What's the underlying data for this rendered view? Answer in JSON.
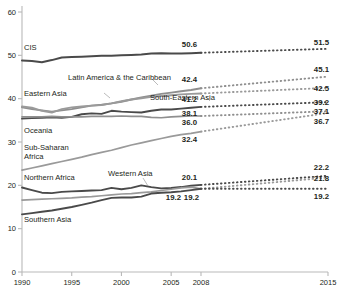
{
  "chart_data": {
    "type": "line",
    "title": "",
    "subtitle": "",
    "xlabel": "",
    "ylabel": "",
    "xlim": [
      1990,
      2015
    ],
    "ylim": [
      0,
      60
    ],
    "yticks": [
      "0",
      "10",
      "20",
      "30",
      "40",
      "50",
      "60"
    ],
    "ytick_values": [
      0,
      10,
      20,
      30,
      40,
      50,
      60
    ],
    "xticks": [
      "1990",
      "1995",
      "2000",
      "2005",
      "2008",
      "2015"
    ],
    "xtick_values": [
      1990,
      1995,
      2000,
      2005,
      2008,
      2015
    ],
    "grid": false,
    "legend": "inline-labels",
    "projection_start_year": 2008,
    "projection_end_year": 2015,
    "projection_style": "dotted",
    "series": [
      {
        "name": "CIS",
        "label": "CIS",
        "color": "#4a4a4a",
        "width": 2.0,
        "x": [
          1990,
          1991,
          1992,
          1993,
          1994,
          1995,
          1996,
          1997,
          1998,
          1999,
          2000,
          2001,
          2002,
          2003,
          2004,
          2005,
          2006,
          2007,
          2008
        ],
        "values": [
          48.8,
          48.7,
          48.4,
          48.9,
          49.5,
          49.6,
          49.7,
          49.8,
          49.9,
          49.9,
          50.0,
          50.1,
          50.2,
          50.4,
          50.5,
          50.4,
          50.4,
          50.5,
          50.6
        ],
        "value_2008": "50.6",
        "value_2015": "51.5",
        "projection": [
          50.6,
          51.5
        ]
      },
      {
        "name": "Latin America & the Caribbean",
        "label": "Latin America & the Caribbean",
        "color": "#8f8f8f",
        "width": 1.9,
        "x": [
          1990,
          1991,
          1992,
          1993,
          1994,
          1995,
          1996,
          1997,
          1998,
          1999,
          2000,
          2001,
          2002,
          2003,
          2004,
          2005,
          2006,
          2007,
          2008
        ],
        "values": [
          38.0,
          37.6,
          37.3,
          37.0,
          37.3,
          37.6,
          38.0,
          38.4,
          38.6,
          38.9,
          39.3,
          39.8,
          40.3,
          40.7,
          41.1,
          41.4,
          41.7,
          42.0,
          42.4
        ],
        "value_2008": "42.4",
        "value_2015": "45.1",
        "projection": [
          42.4,
          45.1
        ]
      },
      {
        "name": "Eastern Asia",
        "label": "Eastern Asia",
        "color": "#9a9a9a",
        "width": 1.9,
        "x": [
          1990,
          1991,
          1992,
          1993,
          1994,
          1995,
          1996,
          1997,
          1998,
          1999,
          2000,
          2001,
          2002,
          2003,
          2004,
          2005,
          2006,
          2007,
          2008
        ],
        "values": [
          38.2,
          37.9,
          37.2,
          36.8,
          37.6,
          38.0,
          38.2,
          38.4,
          38.5,
          38.9,
          39.4,
          39.8,
          40.1,
          40.4,
          40.6,
          40.8,
          41.0,
          41.1,
          41.2
        ],
        "value_2008": "41.2",
        "value_2015": "42.5",
        "projection": [
          41.2,
          42.5
        ]
      },
      {
        "name": "South-Eastern Asia",
        "label": "South-Eastern Asia",
        "color": "#4a4a4a",
        "width": 1.9,
        "x": [
          1990,
          1991,
          1992,
          1993,
          1994,
          1995,
          1996,
          1997,
          1998,
          1999,
          2000,
          2001,
          2002,
          2003,
          2004,
          2005,
          2006,
          2007,
          2008
        ],
        "values": [
          35.4,
          35.5,
          35.6,
          35.7,
          35.6,
          35.8,
          36.4,
          36.6,
          36.5,
          37.2,
          37.0,
          36.9,
          36.8,
          37.2,
          37.5,
          37.5,
          37.7,
          37.9,
          38.1
        ],
        "value_2008": "38.1",
        "value_2015": "39.2",
        "projection": [
          38.1,
          39.2
        ]
      },
      {
        "name": "Oceania",
        "label": "Oceania",
        "color": "#8f8f8f",
        "width": 1.7,
        "x": [
          1990,
          1991,
          1992,
          1993,
          1994,
          1995,
          1996,
          1997,
          1998,
          1999,
          2000,
          2001,
          2002,
          2003,
          2004,
          2005,
          2006,
          2007,
          2008
        ],
        "values": [
          35.8,
          35.8,
          35.8,
          35.9,
          35.8,
          35.8,
          35.8,
          35.9,
          35.9,
          35.9,
          36.0,
          35.9,
          35.9,
          35.7,
          35.6,
          35.8,
          35.9,
          36.0,
          36.0
        ],
        "value_2008": "36.0",
        "value_2015": "37.1",
        "projection": [
          36.0,
          37.1
        ]
      },
      {
        "name": "Sub-Saharan Africa",
        "label": "Sub-Saharan Africa",
        "color": "#9a9a9a",
        "width": 1.7,
        "x": [
          1990,
          1991,
          1992,
          1993,
          1994,
          1995,
          1996,
          1997,
          1998,
          1999,
          2000,
          2001,
          2002,
          2003,
          2004,
          2005,
          2006,
          2007,
          2008
        ],
        "values": [
          23.5,
          24.0,
          24.5,
          25.0,
          25.5,
          26.0,
          26.5,
          27.1,
          27.6,
          28.1,
          28.7,
          29.3,
          29.8,
          30.3,
          30.8,
          31.3,
          31.7,
          32.0,
          32.4
        ],
        "value_2008": "32.4",
        "value_2015": "36.7",
        "projection": [
          32.4,
          36.7
        ]
      },
      {
        "name": "Northern Africa",
        "label": "Northern Africa",
        "color": "#4a4a4a",
        "width": 1.9,
        "x": [
          1990,
          1991,
          1992,
          1993,
          1994,
          1995,
          1996,
          1997,
          1998,
          1999,
          2000,
          2001,
          2002,
          2003,
          2004,
          2005,
          2006,
          2007,
          2008
        ],
        "values": [
          19.5,
          18.9,
          18.3,
          18.2,
          18.5,
          18.6,
          18.7,
          18.8,
          18.9,
          19.4,
          19.1,
          19.4,
          20.0,
          19.6,
          19.3,
          19.4,
          19.6,
          19.9,
          20.1
        ],
        "value_2008": "20.1",
        "value_2015": "22.2",
        "projection": [
          20.1,
          22.2
        ]
      },
      {
        "name": "Western Asia",
        "label": "Western Asia",
        "color": "#9a9a9a",
        "width": 1.7,
        "x": [
          1990,
          1991,
          1992,
          1993,
          1994,
          1995,
          1996,
          1997,
          1998,
          1999,
          2000,
          2001,
          2002,
          2003,
          2004,
          2005,
          2006,
          2007,
          2008
        ],
        "values": [
          16.6,
          16.7,
          16.8,
          16.9,
          17.0,
          17.1,
          17.3,
          17.4,
          17.6,
          17.8,
          18.0,
          18.1,
          18.3,
          18.5,
          18.8,
          19.1,
          19.4,
          19.6,
          19.2
        ],
        "value_2008": "19.2",
        "value_2015": "21.8",
        "projection": [
          19.2,
          21.8
        ]
      },
      {
        "name": "Southern Asia",
        "label": "Southern Asia",
        "color": "#4a4a4a",
        "width": 1.9,
        "x": [
          1990,
          1991,
          1992,
          1993,
          1994,
          1995,
          1996,
          1997,
          1998,
          1999,
          2000,
          2001,
          2002,
          2003,
          2004,
          2005,
          2006,
          2007,
          2008
        ],
        "values": [
          13.3,
          13.6,
          13.9,
          14.2,
          14.6,
          15.0,
          15.5,
          16.0,
          16.6,
          17.1,
          17.2,
          17.2,
          17.4,
          18.1,
          18.3,
          18.4,
          18.6,
          18.9,
          19.2
        ],
        "value_2008": "19.2",
        "value_2015": "19.2",
        "projection": [
          19.2,
          19.2
        ]
      }
    ],
    "annotations_2008": [
      "50.6",
      "42.4",
      "41.2",
      "38.1",
      "36.0",
      "32.4",
      "20.1",
      "19.2",
      "19.2"
    ],
    "annotations_2015": [
      "51.5",
      "45.1",
      "42.5",
      "39.2",
      "37.1",
      "36.7",
      "22.2",
      "21.8",
      "19.2"
    ]
  },
  "labels": {
    "cis": "CIS",
    "latin_america": "Latin America & the Caribbean",
    "eastern_asia": "Eastern Asia",
    "south_eastern_asia": "South-Eastern Asia",
    "oceania": "Oceania",
    "sub_saharan_line1": "Sub-Saharan",
    "sub_saharan_line2": "Africa",
    "northern_africa": "Northern Africa",
    "western_asia": "Western Asia",
    "southern_asia": "Southern Asia"
  }
}
